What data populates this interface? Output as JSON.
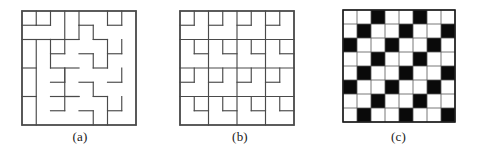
{
  "figure": {
    "panels": [
      {
        "id": "panel-a",
        "caption": "(a)",
        "kind": "tromino-tiling",
        "grid": {
          "rows": 8,
          "cols": 8
        },
        "geometry": {
          "x": 22,
          "y": 11,
          "size": 114,
          "cell": 14.25
        },
        "description": "8 by 8 square dissected into L-shaped tromino tiles",
        "edges": [
          [
            0,
            0,
            8,
            0
          ],
          [
            0,
            8,
            8,
            8
          ],
          [
            0,
            0,
            0,
            8
          ],
          [
            8,
            0,
            8,
            8
          ],
          [
            0,
            1,
            1,
            1
          ],
          [
            1,
            0,
            1,
            1
          ],
          [
            1,
            1,
            2,
            1
          ],
          [
            2,
            1,
            2,
            0
          ],
          [
            0,
            2,
            2,
            2
          ],
          [
            2,
            2,
            2,
            4
          ],
          [
            1,
            2,
            1,
            8
          ],
          [
            0,
            4,
            1,
            4
          ],
          [
            0,
            6,
            1,
            6
          ],
          [
            2,
            4,
            4,
            4
          ],
          [
            2,
            6,
            4,
            6
          ],
          [
            3,
            0,
            3,
            2
          ],
          [
            3,
            2,
            4,
            2
          ],
          [
            4,
            2,
            4,
            1
          ],
          [
            4,
            1,
            5,
            1
          ],
          [
            5,
            1,
            5,
            2
          ],
          [
            5,
            2,
            6,
            2
          ],
          [
            3,
            4,
            3,
            6
          ],
          [
            3,
            6,
            4,
            6
          ],
          [
            2,
            3,
            3,
            3
          ],
          [
            3,
            3,
            3,
            2
          ],
          [
            4,
            3,
            5,
            3
          ],
          [
            5,
            3,
            5,
            4
          ],
          [
            2,
            5,
            3,
            5
          ],
          [
            3,
            5,
            3,
            4
          ],
          [
            4,
            5,
            5,
            5
          ],
          [
            5,
            5,
            5,
            6
          ],
          [
            2,
            7,
            3,
            7
          ],
          [
            3,
            7,
            3,
            6
          ],
          [
            4,
            7,
            5,
            7
          ],
          [
            5,
            7,
            5,
            8
          ],
          [
            6,
            0,
            6,
            1
          ],
          [
            6,
            1,
            7,
            1
          ],
          [
            7,
            1,
            7,
            0
          ],
          [
            6,
            2,
            6,
            4
          ],
          [
            5,
            4,
            6,
            4
          ],
          [
            6,
            3,
            7,
            3
          ],
          [
            7,
            3,
            7,
            2
          ],
          [
            6,
            5,
            7,
            5
          ],
          [
            7,
            5,
            7,
            4
          ],
          [
            6,
            6,
            6,
            8
          ],
          [
            5,
            6,
            6,
            6
          ],
          [
            6,
            7,
            7,
            7
          ],
          [
            7,
            7,
            7,
            6
          ],
          [
            4,
            0,
            4,
            1
          ],
          [
            2,
            2,
            3,
            2
          ]
        ]
      },
      {
        "id": "panel-b",
        "caption": "(b)",
        "kind": "tromino-tiling",
        "grid": {
          "rows": 8,
          "cols": 8
        },
        "geometry": {
          "x": 20,
          "y": 11,
          "size": 114,
          "cell": 14.25
        },
        "description": "8 by 8 square dissected into L-shaped tromino tiles, alternate dissection",
        "edges": [
          [
            0,
            0,
            8,
            0
          ],
          [
            0,
            8,
            8,
            8
          ],
          [
            0,
            0,
            0,
            8
          ],
          [
            8,
            0,
            8,
            8
          ],
          [
            0,
            2,
            8,
            2
          ],
          [
            0,
            4,
            8,
            4
          ],
          [
            0,
            6,
            8,
            6
          ],
          [
            2,
            0,
            2,
            8
          ],
          [
            4,
            0,
            4,
            8
          ],
          [
            6,
            0,
            6,
            8
          ],
          [
            0,
            1,
            1,
            1
          ],
          [
            1,
            1,
            1,
            0
          ],
          [
            2,
            1,
            3,
            1
          ],
          [
            3,
            1,
            3,
            0
          ],
          [
            4,
            1,
            5,
            1
          ],
          [
            5,
            1,
            5,
            0
          ],
          [
            6,
            1,
            7,
            1
          ],
          [
            7,
            1,
            7,
            0
          ],
          [
            1,
            2,
            1,
            3
          ],
          [
            1,
            3,
            2,
            3
          ],
          [
            3,
            2,
            3,
            3
          ],
          [
            3,
            3,
            4,
            3
          ],
          [
            5,
            2,
            5,
            3
          ],
          [
            5,
            3,
            6,
            3
          ],
          [
            7,
            2,
            7,
            3
          ],
          [
            7,
            3,
            8,
            3
          ],
          [
            0,
            5,
            1,
            5
          ],
          [
            1,
            5,
            1,
            4
          ],
          [
            2,
            5,
            3,
            5
          ],
          [
            3,
            5,
            3,
            4
          ],
          [
            4,
            5,
            5,
            5
          ],
          [
            5,
            5,
            5,
            4
          ],
          [
            6,
            5,
            7,
            5
          ],
          [
            7,
            5,
            7,
            4
          ],
          [
            1,
            6,
            1,
            7
          ],
          [
            1,
            7,
            2,
            7
          ],
          [
            3,
            6,
            3,
            7
          ],
          [
            3,
            7,
            4,
            7
          ],
          [
            5,
            6,
            5,
            7
          ],
          [
            5,
            7,
            6,
            7
          ],
          [
            7,
            6,
            7,
            7
          ],
          [
            7,
            7,
            8,
            7
          ]
        ]
      },
      {
        "id": "panel-c",
        "caption": "(c)",
        "kind": "coloring",
        "grid": {
          "rows": 8,
          "cols": 8
        },
        "geometry": {
          "x": 23,
          "y": 10,
          "size": 112,
          "cell": 14
        },
        "description": "8 by 8 board colored with diagonal stripes of black cells, period three",
        "colors": {
          "black": "#0a0a0a",
          "white": "#ffffff",
          "grid_line": "#555555"
        },
        "black_cells": [
          [
            0,
            2
          ],
          [
            0,
            5
          ],
          [
            1,
            1
          ],
          [
            1,
            4
          ],
          [
            1,
            7
          ],
          [
            2,
            0
          ],
          [
            2,
            3
          ],
          [
            2,
            6
          ],
          [
            3,
            2
          ],
          [
            3,
            5
          ],
          [
            4,
            1
          ],
          [
            4,
            4
          ],
          [
            4,
            7
          ],
          [
            5,
            0
          ],
          [
            5,
            3
          ],
          [
            5,
            6
          ],
          [
            6,
            2
          ],
          [
            6,
            5
          ],
          [
            7,
            1
          ],
          [
            7,
            4
          ],
          [
            7,
            7
          ]
        ]
      }
    ]
  }
}
